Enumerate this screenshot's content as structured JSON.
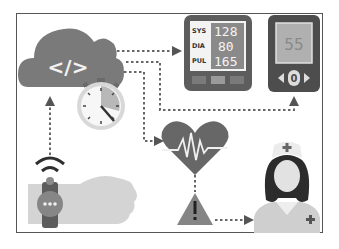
{
  "diagram": {
    "nodes": {
      "cloud": {
        "label": "</>",
        "icon": "cloud-code-icon"
      },
      "stopwatch": {
        "icon": "stopwatch-icon"
      },
      "bp_monitor": {
        "icon": "blood-pressure-monitor-icon",
        "rows": [
          {
            "label": "SYS",
            "value": "128"
          },
          {
            "label": "DIA",
            "value": "80"
          },
          {
            "label": "PUL",
            "value": "165"
          }
        ]
      },
      "glucometer": {
        "icon": "glucometer-icon",
        "reading": "55",
        "button": "0"
      },
      "heart": {
        "icon": "heart-pulse-icon"
      },
      "alert": {
        "icon": "warning-triangle-icon",
        "symbol": "!"
      },
      "nurse": {
        "icon": "nurse-icon"
      },
      "smartwatch": {
        "icon": "smartwatch-wrist-icon",
        "face": "•••"
      }
    },
    "edges": [
      {
        "from": "smartwatch",
        "to": "cloud"
      },
      {
        "from": "cloud",
        "to": "bp_monitor"
      },
      {
        "from": "cloud",
        "to": "glucometer"
      },
      {
        "from": "cloud",
        "to": "heart"
      },
      {
        "from": "heart",
        "to": "alert"
      },
      {
        "from": "alert",
        "to": "nurse"
      }
    ],
    "colors": {
      "dark": "#5a5a5a",
      "mid": "#8a8a8a",
      "light": "#c8c8c8",
      "lighter": "#dcdcdc",
      "frame": "#555555"
    }
  }
}
